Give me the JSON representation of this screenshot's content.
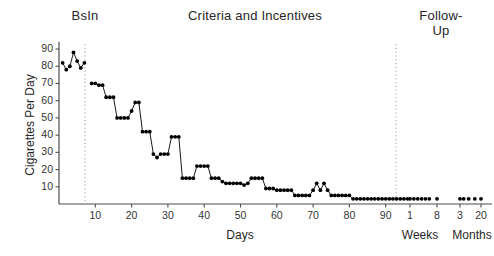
{
  "figure": {
    "phase_labels": {
      "baseline": "BsIn",
      "criteria": "Criteria and Incentives",
      "followup": "Follow-\nUp"
    },
    "axis_titles": {
      "y": "Cigarettes Per Day",
      "x": "Days",
      "x_weeks": "Weeks",
      "x_months": "Months"
    },
    "colors": {
      "marker": "#000000",
      "axis": "#4d4d4d",
      "phase_line": "#999999",
      "background": "#ffffff"
    }
  },
  "chart_data": {
    "type": "scatter",
    "title": "",
    "subtitle": "",
    "xlabel": "Days",
    "ylabel": "Cigarettes Per Day",
    "xlim": [
      0,
      97
    ],
    "ylim": [
      0,
      93
    ],
    "grid": false,
    "legend_position": "none",
    "yticks": [
      10,
      20,
      30,
      40,
      50,
      60,
      70,
      80,
      90
    ],
    "xticks": [
      10,
      20,
      30,
      40,
      50,
      60,
      70,
      80,
      90
    ],
    "followup_xticks_weeks": [
      1,
      8
    ],
    "followup_xticks_months": [
      3,
      20
    ],
    "phase_lines_at_days": [
      7,
      96
    ],
    "annotations": [
      "BsIn",
      "Criteria and Incentives",
      "Follow-Up"
    ],
    "series": [
      {
        "name": "Baseline",
        "connected": true,
        "x": [
          1,
          2,
          3,
          4,
          5,
          6,
          7
        ],
        "y": [
          82,
          78,
          80,
          88,
          83,
          79,
          82
        ]
      },
      {
        "name": "Criteria and Incentives",
        "connected": true,
        "x": [
          9,
          10,
          11,
          12,
          13,
          14,
          15,
          16,
          17,
          18,
          19,
          20,
          21,
          22,
          23,
          24,
          25,
          26,
          27,
          28,
          29,
          30,
          31,
          32,
          33,
          34,
          35,
          36,
          37,
          38,
          39,
          40,
          41,
          42,
          43,
          44,
          45,
          46,
          47,
          48,
          49,
          50,
          51,
          52,
          53,
          54,
          55,
          56,
          57,
          58,
          59,
          60,
          61,
          62,
          63,
          64,
          65,
          66,
          67,
          68,
          69,
          70,
          71,
          72,
          73,
          74,
          75,
          76,
          77,
          78,
          79,
          80,
          81,
          82,
          83,
          84,
          85,
          86,
          87,
          88,
          89,
          90,
          91,
          92,
          93,
          94,
          95,
          96
        ],
        "y": [
          70,
          70,
          69,
          69,
          62,
          62,
          62,
          50,
          50,
          50,
          50,
          54,
          59,
          59,
          42,
          42,
          42,
          29,
          27,
          29,
          29,
          29,
          39,
          39,
          39,
          15,
          15,
          15,
          15,
          22,
          22,
          22,
          22,
          15,
          15,
          15,
          13,
          12,
          12,
          12,
          12,
          12,
          11,
          12,
          15,
          15,
          15,
          15,
          9,
          9,
          9,
          8,
          8,
          8,
          8,
          8,
          5,
          5,
          5,
          5,
          5,
          8,
          12,
          8,
          12,
          8,
          5,
          5,
          5,
          5,
          5,
          5,
          3,
          3,
          3,
          3,
          3,
          3,
          3,
          3,
          3,
          3,
          3,
          3,
          3,
          3,
          3,
          3
        ]
      },
      {
        "name": "Follow-Up Weeks",
        "connected": false,
        "x_weeks": [
          1,
          2,
          3,
          4,
          5,
          6,
          8
        ],
        "y": [
          3,
          3,
          3,
          3,
          3,
          3,
          3
        ]
      },
      {
        "name": "Follow-Up Months",
        "connected": false,
        "x_months": [
          3,
          6,
          10,
          15,
          20
        ],
        "y": [
          3,
          3,
          3,
          3,
          3
        ]
      }
    ]
  }
}
